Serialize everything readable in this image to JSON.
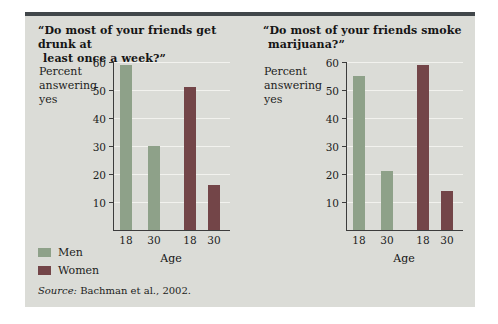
{
  "figure": {
    "accent_color": "#41474a",
    "panel_bg": "#dbdcd7",
    "source": {
      "prefix": "Source:",
      "text": " Bachman et al., 2002."
    }
  },
  "legend": {
    "position": "bottom-left",
    "items": [
      {
        "label": "Men",
        "color": "#8ea189"
      },
      {
        "label": "Women",
        "color": "#734548"
      }
    ]
  },
  "chart_data": [
    {
      "type": "bar",
      "title": "“Do most of your friends get drunk at least once a week?”",
      "title_lines": [
        "“Do most of your friends get drunk at",
        "least once a week?”"
      ],
      "ylabel": "Percent answering yes",
      "xlabel": "Age",
      "ylim": [
        0,
        60
      ],
      "yticks": [
        10,
        20,
        30,
        40,
        50,
        60
      ],
      "grid": true,
      "legend_shown": true,
      "categories": [
        "18",
        "30"
      ],
      "series": [
        {
          "name": "Men",
          "color": "#8ea189",
          "values": [
            59,
            30
          ]
        },
        {
          "name": "Women",
          "color": "#734548",
          "values": [
            51,
            16
          ]
        }
      ]
    },
    {
      "type": "bar",
      "title": "“Do most of your friends smoke marijuana?”",
      "title_lines": [
        "“Do most of your friends smoke",
        "marijuana?”"
      ],
      "ylabel": "Percent answering yes",
      "xlabel": "Age",
      "ylim": [
        0,
        60
      ],
      "yticks": [
        10,
        20,
        30,
        40,
        50,
        60
      ],
      "grid": true,
      "legend_shown": false,
      "categories": [
        "18",
        "30"
      ],
      "series": [
        {
          "name": "Men",
          "color": "#8ea189",
          "values": [
            55,
            21
          ]
        },
        {
          "name": "Women",
          "color": "#734548",
          "values": [
            59,
            14
          ]
        }
      ]
    }
  ]
}
